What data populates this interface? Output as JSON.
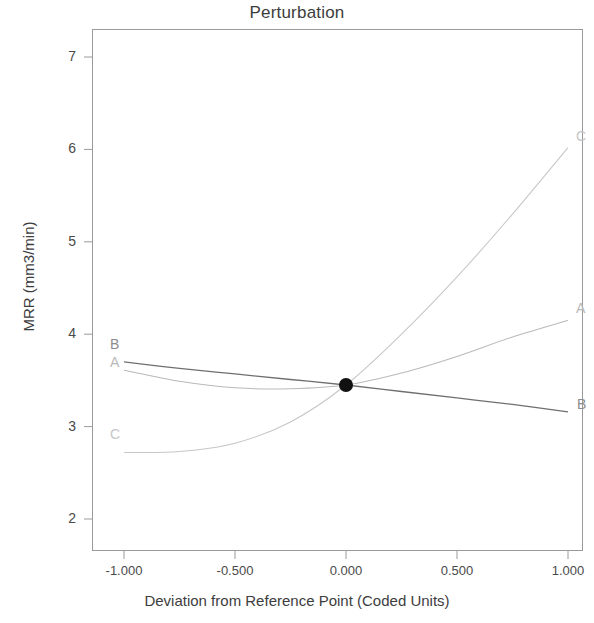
{
  "chart": {
    "title": "Perturbation",
    "xlabel": "Deviation from Reference Point (Coded Units)",
    "ylabel": "MRR (mm3/min)",
    "ytick_labels": [
      "7",
      "6",
      "5",
      "4",
      "3",
      "2"
    ],
    "xtick_labels": [
      "-1.000",
      "-0.500",
      "0.000",
      "0.500",
      "1.000"
    ],
    "labels_left": {
      "A": "A",
      "B": "B",
      "C": "C"
    },
    "labels_right": {
      "A": "A",
      "B": "B",
      "C": "C"
    },
    "colors": {
      "series_A": "#b9b9b9",
      "series_B": "#6f6f6f",
      "series_C": "#c6c6c6",
      "frame": "#9a9a9a",
      "center_point": "#111111",
      "text": "#4a4a4a"
    }
  },
  "chart_data": {
    "type": "line",
    "title": "Perturbation",
    "xlabel": "Deviation from Reference Point (Coded Units)",
    "ylabel": "MRR (mm3/min)",
    "xlim": [
      -1.0,
      1.0
    ],
    "ylim": [
      1.7,
      7.35
    ],
    "xticks": [
      -1.0,
      -0.5,
      0.0,
      0.5,
      1.0
    ],
    "xticklabels": [
      "-1.000",
      "-0.500",
      "0.000",
      "0.500",
      "1.000"
    ],
    "yticks": [
      2,
      3,
      4,
      5,
      6,
      7
    ],
    "yticklabels": [
      "2",
      "3",
      "4",
      "5",
      "6",
      "7"
    ],
    "grid": false,
    "legend": "inline-endpoint-labels",
    "reference_point": {
      "x": 0.0,
      "y": 3.45
    },
    "x": [
      -1.0,
      -0.75,
      -0.5,
      -0.25,
      0.0,
      0.25,
      0.5,
      0.75,
      1.0
    ],
    "series": [
      {
        "name": "A",
        "label_left": "A",
        "label_right": "A",
        "values": [
          3.61,
          3.49,
          3.42,
          3.41,
          3.45,
          3.58,
          3.76,
          3.97,
          4.15
        ]
      },
      {
        "name": "B",
        "label_left": "B",
        "label_right": "B",
        "values": [
          3.7,
          3.63,
          3.57,
          3.51,
          3.45,
          3.38,
          3.31,
          3.24,
          3.16
        ]
      },
      {
        "name": "C",
        "label_left": "C",
        "label_right": "C",
        "values": [
          2.72,
          2.73,
          2.82,
          3.05,
          3.45,
          4.0,
          4.62,
          5.3,
          6.02
        ]
      }
    ]
  }
}
